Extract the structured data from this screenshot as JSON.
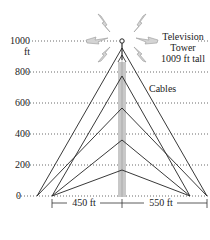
{
  "y_axis": {
    "ticks": [
      {
        "label": "1000",
        "value": 1000
      },
      {
        "label": "800",
        "value": 800
      },
      {
        "label": "600",
        "value": 600
      },
      {
        "label": "400",
        "value": 400
      },
      {
        "label": "200",
        "value": 200
      },
      {
        "label": "0",
        "value": 0
      }
    ],
    "unit": "ft"
  },
  "tower": {
    "label_line1": "Television",
    "label_line2": "Tower",
    "label_line3": "1009 ft tall",
    "height_ft": 1009
  },
  "cables_label": "Cables",
  "dimensions": {
    "left": "450 ft",
    "right": "550 ft"
  },
  "colors": {
    "line": "#222222",
    "tower_fill": "#c8c8c8",
    "signal_fill": "#d4d4d4"
  }
}
